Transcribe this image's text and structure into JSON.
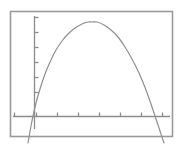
{
  "screen": {
    "width": 182,
    "height": 146,
    "background_color": "#ffffff",
    "title": "Graphing calculator plot of a downward parabola"
  },
  "frame": {
    "label": "plot-border",
    "x": 10,
    "y": 11,
    "width": 162,
    "height": 125,
    "stroke_color": "#9a9a9a",
    "stroke_width": 1.6,
    "fill": "none"
  },
  "axes": {
    "stroke_color": "#8c8c8c",
    "stroke_width": 1.3,
    "tick_length": 4,
    "x_axis": {
      "label": "x-axis",
      "y_pixel": 116,
      "x_start": 13,
      "x_end": 170,
      "tick_count": 8,
      "tick_pixels": [
        14,
        36,
        57,
        78,
        99,
        120,
        141,
        162
      ],
      "tick_labels": []
    },
    "y_axis": {
      "label": "y-axis",
      "x_pixel": 34,
      "y_start": 16,
      "y_end": 129,
      "tick_count": 6,
      "tick_pixels": [
        17,
        32,
        47,
        62,
        77,
        92
      ],
      "tick_labels": []
    }
  },
  "chart_data": {
    "type": "line",
    "title": "",
    "subtitle": "",
    "xlabel": "",
    "ylabel": "",
    "grid": false,
    "legend": null,
    "curve_name": "downward-parabola",
    "curve_color": "#8f8f8f",
    "curve_width": 1.2,
    "equation_form": "y = a(x - h)^2 + k, a < 0",
    "vertex": {
      "x": 92,
      "y": 22
    },
    "x_intercepts_pixels": [
      33,
      155
    ],
    "axis_origin_pixels": {
      "x": 34,
      "y": 116
    },
    "xlim_pixels": [
      10,
      172
    ],
    "ylim_pixels": [
      11,
      136
    ],
    "points": [
      {
        "x": 28,
        "y": 143
      },
      {
        "x": 31,
        "y": 126
      },
      {
        "x": 33,
        "y": 116
      },
      {
        "x": 36,
        "y": 103
      },
      {
        "x": 40,
        "y": 89
      },
      {
        "x": 45,
        "y": 74
      },
      {
        "x": 50,
        "y": 62
      },
      {
        "x": 56,
        "y": 50
      },
      {
        "x": 62,
        "y": 41
      },
      {
        "x": 68,
        "y": 34
      },
      {
        "x": 75,
        "y": 28
      },
      {
        "x": 82,
        "y": 24
      },
      {
        "x": 88,
        "y": 22
      },
      {
        "x": 92,
        "y": 22
      },
      {
        "x": 97,
        "y": 22
      },
      {
        "x": 104,
        "y": 25
      },
      {
        "x": 111,
        "y": 30
      },
      {
        "x": 118,
        "y": 37
      },
      {
        "x": 125,
        "y": 47
      },
      {
        "x": 132,
        "y": 59
      },
      {
        "x": 139,
        "y": 73
      },
      {
        "x": 146,
        "y": 90
      },
      {
        "x": 152,
        "y": 107
      },
      {
        "x": 155,
        "y": 116
      },
      {
        "x": 160,
        "y": 131
      },
      {
        "x": 164,
        "y": 143
      }
    ]
  }
}
